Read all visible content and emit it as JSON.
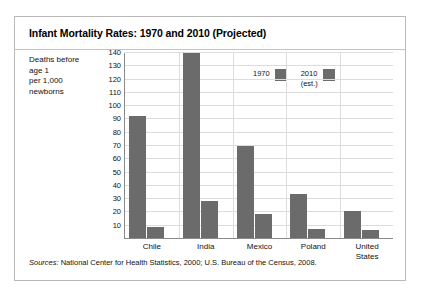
{
  "title": "Infant Mortality Rates: 1970 and 2010 (Projected)",
  "axis_caption": {
    "line1": "Deaths before",
    "line2": "age 1",
    "line3": "per 1,000",
    "line4": "newborns"
  },
  "legend": {
    "item1_line1": "1970",
    "item1_line2": "",
    "item2_line1": "2010",
    "item2_line2": "(est.)"
  },
  "source": {
    "label": "Sources:",
    "text": " National Center for Health Statistics, 2000; U.S. Bureau of the Census, 2008."
  },
  "colors": {
    "bar": "#6b6b6b",
    "grid": "#dcdcdc",
    "axis": "#8a8a8a",
    "frame": "#b9b9b9"
  },
  "chart_data": {
    "type": "bar",
    "title": "Infant Mortality Rates: 1970 and 2010 (Projected)",
    "xlabel": "",
    "ylabel": "Deaths before age 1 per 1,000 newborns",
    "ylim": [
      0,
      140
    ],
    "yticks": [
      10,
      20,
      30,
      40,
      50,
      60,
      70,
      80,
      90,
      100,
      110,
      120,
      130,
      140
    ],
    "grid": true,
    "legend_position": "inside-upper-center",
    "categories": [
      "Chile",
      "India",
      "Mexico",
      "Poland",
      "United States"
    ],
    "category_labels": [
      [
        "Chile"
      ],
      [
        "India"
      ],
      [
        "Mexico"
      ],
      [
        "Poland"
      ],
      [
        "United",
        "States"
      ]
    ],
    "series": [
      {
        "name": "1970",
        "values": [
          92,
          139,
          69,
          33,
          20
        ]
      },
      {
        "name": "2010 (est.)",
        "values": [
          8,
          28,
          18,
          7,
          6
        ]
      }
    ]
  }
}
